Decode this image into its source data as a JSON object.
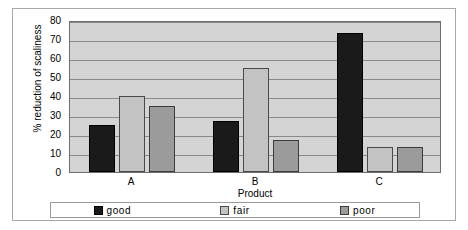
{
  "chart_data": {
    "type": "bar",
    "title": "",
    "xlabel": "Product",
    "ylabel": "% reduction of scaliness",
    "categories": [
      "A",
      "B",
      "C"
    ],
    "series": [
      {
        "name": "good",
        "color": "#1a1a1a",
        "values": [
          25,
          27,
          73
        ]
      },
      {
        "name": "fair",
        "color": "#c3c3c3",
        "values": [
          40,
          55,
          13
        ]
      },
      {
        "name": "poor",
        "color": "#9b9b9b",
        "values": [
          35,
          17,
          13
        ]
      }
    ],
    "ylim": [
      0,
      80
    ],
    "ytick_step": 10,
    "yticks": [
      80,
      70,
      60,
      50,
      40,
      30,
      20,
      10,
      0
    ],
    "grid": true,
    "legend_position": "bottom",
    "plot_background": "#d4d4d4"
  },
  "legend": {
    "items": [
      {
        "label": "good"
      },
      {
        "label": "fair"
      },
      {
        "label": "poor"
      }
    ]
  }
}
